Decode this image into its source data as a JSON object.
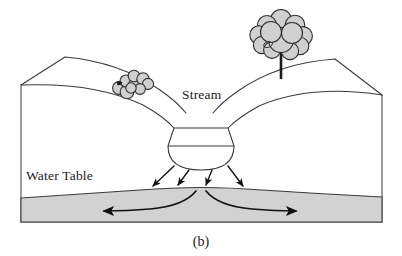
{
  "figure": {
    "caption": "(b)",
    "width": 402,
    "height": 256
  },
  "labels": {
    "stream": "Stream",
    "water_table": "Water Table"
  },
  "colors": {
    "aquifer_fill": "#d2d2d2",
    "foliage_fill": "#d0d0d0",
    "outline": "#3a3a3a",
    "arrow": "#111111",
    "background": "#ffffff",
    "text": "#1a1a1a"
  },
  "elements": {
    "stream_channel": {
      "name": "stream channel cross section",
      "description": "Trapezoidal channel narrowing downward with horizontal water surface line and rounded bed"
    },
    "water_table_surface": {
      "name": "water table",
      "description": "Gently domed saturated surface mounding beneath the stream"
    },
    "large_tree": {
      "name": "tree",
      "description": "Cloud-shaped canopy with straight vertical trunk on right hillslope"
    },
    "small_shrub": {
      "name": "shrub",
      "description": "Low cluster of cloud lobes on left hillslope"
    },
    "recharge_arrows": {
      "name": "recharge arrows",
      "count": 4,
      "direction": "downward",
      "description": "Seepage from stream bed down to the water table"
    },
    "groundwater_arrows": {
      "name": "groundwater flow arrows",
      "count": 2,
      "direction": "outward left and right",
      "description": "Curved flow lines diverging from beneath the stream through the aquifer"
    }
  }
}
